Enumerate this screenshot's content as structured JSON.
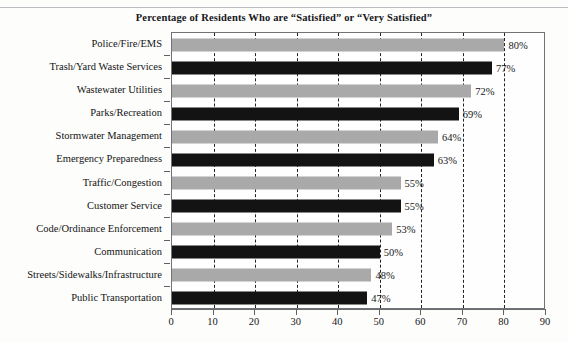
{
  "chart_data": {
    "type": "bar",
    "orientation": "horizontal",
    "title": "Percentage of Residents Who are “Satisfied” or “Very Satisfied”",
    "xlabel": "",
    "ylabel": "",
    "xlim": [
      0,
      90
    ],
    "xticks": [
      0,
      10,
      20,
      30,
      40,
      50,
      60,
      70,
      80,
      90
    ],
    "xtick_labels": [
      "0",
      "10",
      "20",
      "30",
      "40",
      "50",
      "60",
      "70",
      "80",
      "90"
    ],
    "grid": "vertical-dashed",
    "legend": "none",
    "value_suffix": "%",
    "categories": [
      "Police/Fire/EMS",
      "Trash/Yard Waste Services",
      "Wastewater Utilities",
      "Parks/Recreation",
      "Stormwater Management",
      "Emergency Preparedness",
      "Traffic/Congestion",
      "Customer Service",
      "Code/Ordinance Enforcement",
      "Communication",
      "Streets/Sidewalks/Infrastructure",
      "Public Transportation"
    ],
    "values": [
      80,
      77,
      72,
      69,
      64,
      63,
      55,
      55,
      53,
      50,
      48,
      47
    ],
    "data_labels": [
      "80%",
      "77%",
      "72%",
      "69%",
      "64%",
      "63%",
      "55%",
      "55%",
      "53%",
      "50%",
      "48%",
      "47%"
    ],
    "bar_colors": [
      "#a9a9a9",
      "#131313",
      "#a9a9a9",
      "#131313",
      "#a9a9a9",
      "#131313",
      "#a9a9a9",
      "#131313",
      "#a9a9a9",
      "#131313",
      "#a9a9a9",
      "#131313"
    ],
    "colors": {
      "gray": "#a9a9a9",
      "black": "#131313",
      "axis": "#6a6e71",
      "grid": "#222222",
      "background": "#fefefe"
    }
  }
}
